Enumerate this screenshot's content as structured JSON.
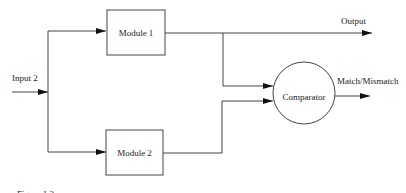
{
  "diagram": {
    "type": "block-diagram",
    "input": {
      "label": "Input 2"
    },
    "modules": [
      {
        "id": "module1",
        "label": "Module 1"
      },
      {
        "id": "module2",
        "label": "Module 2"
      }
    ],
    "comparator": {
      "label": "Comparator"
    },
    "outputs": {
      "primary": "Output",
      "comparator": "Match/Mismatch"
    },
    "caption": "Figure 1.2",
    "edges": [
      {
        "from": "Input 2",
        "to": "Module 1"
      },
      {
        "from": "Input 2",
        "to": "Module 2"
      },
      {
        "from": "Module 1",
        "to": "Output"
      },
      {
        "from": "Module 1",
        "to": "Comparator"
      },
      {
        "from": "Module 2",
        "to": "Comparator"
      },
      {
        "from": "Comparator",
        "to": "Match/Mismatch"
      }
    ],
    "colors": {
      "stroke": "#444444",
      "text": "#222222",
      "background": "#ffffff"
    }
  }
}
